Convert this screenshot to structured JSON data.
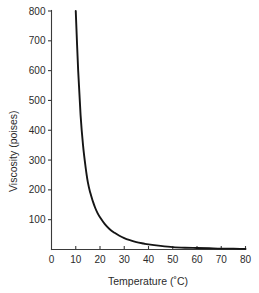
{
  "chart_data": {
    "type": "line",
    "title": "",
    "xlabel": "Temperature (˚C)",
    "ylabel": "Viscosity (poises)",
    "xlim": [
      0,
      80
    ],
    "ylim": [
      0,
      800
    ],
    "grid": false,
    "legend": null,
    "xticks": [
      0,
      10,
      20,
      30,
      40,
      50,
      60,
      70,
      80
    ],
    "xtick_labels": [
      "0",
      "10",
      "20",
      "30",
      "40",
      "50",
      "60",
      "70",
      "80"
    ],
    "yticks": [
      100,
      200,
      300,
      400,
      500,
      600,
      700,
      800
    ],
    "ytick_labels": [
      "100",
      "200",
      "300",
      "400",
      "500",
      "600",
      "700",
      "800"
    ],
    "series": [
      {
        "name": "viscosity-vs-temperature",
        "color": "#151515",
        "x": [
          10,
          11,
          12,
          13,
          14,
          15,
          16,
          17,
          18,
          19,
          20,
          22,
          24,
          26,
          28,
          30,
          32,
          35,
          38,
          40,
          45,
          50,
          55,
          60,
          65,
          70,
          75,
          80
        ],
        "y": [
          800,
          600,
          450,
          350,
          280,
          225,
          190,
          163,
          140,
          122,
          108,
          85,
          68,
          56,
          46,
          38,
          32,
          25,
          20,
          17,
          12,
          8,
          6,
          5,
          4,
          3,
          3,
          2
        ]
      }
    ]
  },
  "axes": {
    "x_axis_name": "temperature-axis",
    "y_axis_name": "viscosity-axis"
  }
}
